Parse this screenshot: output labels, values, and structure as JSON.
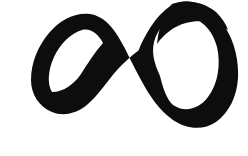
{
  "image": {
    "kind": "scanned-handwritten-mark",
    "subject_name": "infinity-symbol",
    "subject_glyph": "∞",
    "description": "Hand-drawn brush-stroke infinity sign with open tapered ends",
    "width": 248,
    "height": 156,
    "background_color": "#ffffff",
    "ink_color": "#0d0d0d",
    "paper_tone": "#fdfdfd",
    "stroke_count": 1,
    "orientation": "horizontal"
  },
  "artwork": {
    "title": "",
    "caption": "",
    "alt_text": "A thick black hand-painted infinity loop on a white background"
  },
  "geometry": {
    "left_loop": {
      "center_x": 86,
      "center_y": 58,
      "outer_left_x": 31,
      "top_y": 14,
      "bottom_y": 112,
      "stroke_width_min": 12,
      "stroke_width_max": 20
    },
    "right_loop": {
      "center_x": 176,
      "center_y": 64,
      "outer_right_x": 238,
      "top_y": 1,
      "bottom_y": 134,
      "stroke_width_min": 16,
      "stroke_width_max": 30
    },
    "crossing_point": {
      "x": 124,
      "y": 62
    },
    "tips": [
      {
        "name": "upper-tip",
        "x": 138,
        "y": 51,
        "direction": "up-right"
      },
      {
        "name": "lower-tip",
        "x": 94,
        "y": 85,
        "direction": "up-right"
      }
    ]
  },
  "ink_path": "M138.5 50.5 C 130 57, 120 66, 112 76 C 104 86, 97 96, 88 104 C 78 113, 64 117, 52 112 C 39 107, 31 94, 31 80 C 31 63, 38 46, 49 33 C 60 20, 75 12, 90 14 C 103 16, 112 26, 119 38 C 127 51, 133 66, 141 80 C 149 95, 159 110, 173 120 C 186 129, 203 131, 216 122 C 229 113, 237 96, 238 78 C 239 57, 233 36, 220 20 C 209 6, 192 -2, 177 3 C 166 7, 157 17, 150 28 C 145 36, 141 44, 138.5 50.5 Z",
  "ink_path_inner_left": "M52 92 C 47 84, 48 70, 54 57 C 60 44, 71 33, 82 30 C 91 28, 98 34, 103 43 C 95 52, 88 63, 81 74 C 74 84, 64 92, 52 92 Z",
  "ink_path_inner_right": "M160 76 C 154 63, 150 50, 156 36 C 162 22, 175 15, 188 17 C 202 19, 213 31, 217 47 C 221 64, 218 84, 208 97 C 199 109, 185 113, 173 105 C 167 100, 163 88, 160 76 Z",
  "ink_wedge_top_right": "M172 4 C 185 -1, 203 1, 216 12 C 222 18, 226 24, 228 30 C 216 22, 200 19, 186 23 C 174 26, 164 34, 157 44 C 158 32, 163 12, 172 4 Z",
  "accessibility": {
    "role": "img",
    "label": "Hand-drawn infinity symbol"
  }
}
